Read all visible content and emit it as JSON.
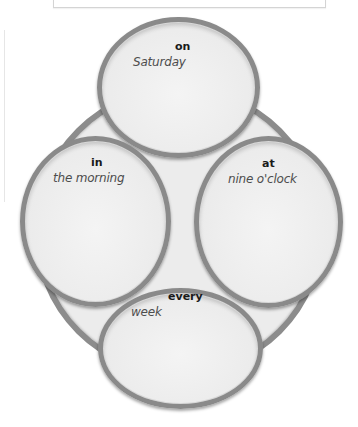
{
  "diagram": {
    "type": "word-association-cluster",
    "colors": {
      "bubble_fill": "#ebebeb",
      "bubble_border": "#8a8a8a",
      "ring_fill": "#ececec",
      "ring_border": "#8c8c8c",
      "preposition_text": "#1a1a1a",
      "phrase_text": "#4d4d4d"
    },
    "bubbles": [
      {
        "position": "top",
        "preposition": "on",
        "phrase": "Saturday"
      },
      {
        "position": "left",
        "preposition": "in",
        "phrase": "the morning"
      },
      {
        "position": "right",
        "preposition": "at",
        "phrase": "nine o'clock"
      },
      {
        "position": "bottom",
        "preposition": "every",
        "phrase": "week"
      }
    ]
  }
}
